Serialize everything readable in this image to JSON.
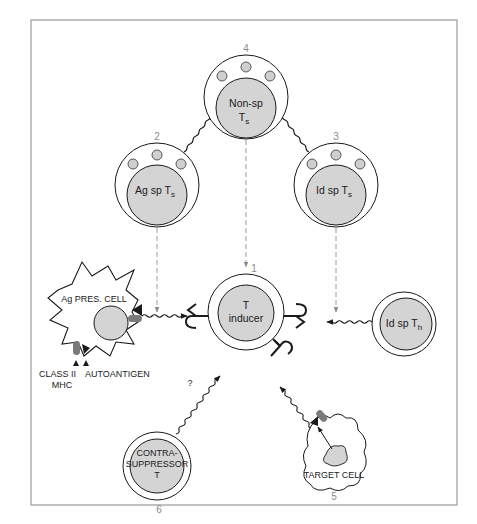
{
  "figure": {
    "border_color": "#9a9a9a",
    "cell_fill": "#d4d4d4",
    "granule_fill": "#cfcfcf",
    "line_color": "#1a1a1a",
    "dashed_color": "#9a9a9a",
    "receptor_color": "#7a7a7a"
  },
  "nodes": [
    {
      "id": "1",
      "number": "1",
      "label_main": "T",
      "label_line2": "inducer"
    },
    {
      "id": "2",
      "number": "2",
      "label_main": "Ag sp T",
      "label_sub": "s"
    },
    {
      "id": "3",
      "number": "3",
      "label_main": "Id sp T",
      "label_sub": "s"
    },
    {
      "id": "4",
      "number": "4",
      "label_main": "Non-sp",
      "label_line2_main": "T",
      "label_line2_sub": "s"
    },
    {
      "id": "5",
      "number": "5",
      "label_main": "TARGET CELL"
    },
    {
      "id": "6",
      "number": "6",
      "label_line1": "CONTRA-",
      "label_line2": "SUPPRESSOR",
      "label_line3": "T"
    },
    {
      "id": "apc",
      "label_main": "Ag PRES. CELL"
    },
    {
      "id": "idth",
      "label_main": "Id sp T",
      "label_sub": "h"
    }
  ],
  "annotations": {
    "class_ii": "CLASS II",
    "mhc": "MHC",
    "autoantigen": "AUTOANTIGEN",
    "question": "?"
  },
  "edges": [
    {
      "from": "2",
      "to": "4",
      "style": "wavy-arrow"
    },
    {
      "from": "3",
      "to": "4",
      "style": "wavy-arrow"
    },
    {
      "from": "4",
      "to": "1",
      "style": "dashed-arrow"
    },
    {
      "from": "2",
      "to": "apc-link",
      "style": "dashed-arrow"
    },
    {
      "from": "3",
      "to": "idth-link",
      "style": "dashed-arrow"
    },
    {
      "from": "apc",
      "to": "1",
      "style": "wavy-arrow"
    },
    {
      "from": "idth",
      "to": "1",
      "style": "wavy-arrow"
    },
    {
      "from": "6",
      "to": "1",
      "style": "wavy-arrow",
      "label": "?"
    },
    {
      "from": "5",
      "to": "1",
      "style": "wavy-arrow"
    }
  ]
}
